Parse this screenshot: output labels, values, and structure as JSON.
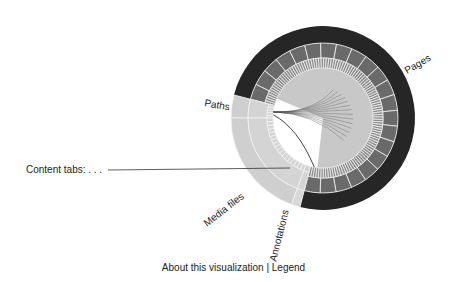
{
  "visualization": {
    "center": [
      323,
      118
    ],
    "rings": {
      "outer": [
        75,
        92
      ],
      "middle": [
        60,
        75
      ],
      "ticks": [
        50,
        60
      ]
    },
    "colors": {
      "pages_outer": "#262626",
      "pages_middle": "#6a6a6a",
      "pages_ticks": "#8c8c8c",
      "pages_disc": "#c8c8c8",
      "light_outer": "#cfcfcf",
      "light_middle": "#d4d4d4",
      "annotation": "#d8d8d8",
      "divider": "#f2f2f2",
      "chord": "#555555"
    },
    "segments": [
      {
        "id": "pages",
        "label": "Pages",
        "start": -165.5,
        "end": 104.5
      },
      {
        "id": "annotations",
        "label": "Annotations",
        "start": 104.5,
        "end": 110
      },
      {
        "id": "media",
        "label": "Media files",
        "start": 110,
        "end": 180
      },
      {
        "id": "paths",
        "label": "Paths",
        "start": 180,
        "end": 194.5
      }
    ],
    "labels": {
      "pages": "Pages",
      "paths": "Paths",
      "media": "Media files",
      "annotations": "Annotations"
    }
  },
  "content_tabs_label": "Content tabs: . . .",
  "footer": {
    "about": "About this visualization",
    "separator": "|",
    "legend": "Legend"
  }
}
